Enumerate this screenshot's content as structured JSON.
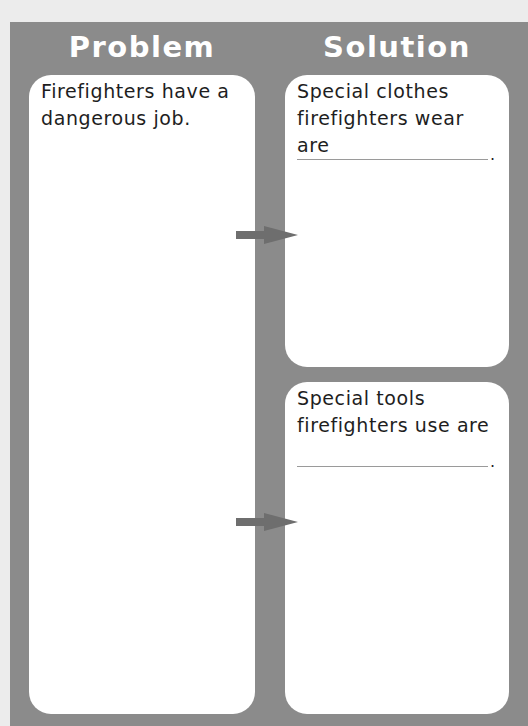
{
  "organizer": {
    "colors": {
      "background": "#ececec",
      "frame": "#8b8b8b",
      "box": "#ffffff",
      "arrow": "#6e6e6e",
      "header_text": "#ffffff",
      "body_text": "#1e1e1e"
    },
    "problem": {
      "header": "Problem",
      "text": "Firefighters have a\ndangerous job."
    },
    "solution": {
      "header": "Solution",
      "items": [
        {
          "text": "Special clothes\nfirefighters wear are",
          "blank": "",
          "period": "."
        },
        {
          "text": "Special tools\nfirefighters use are",
          "blank": "",
          "period": "."
        }
      ]
    },
    "arrows": [
      {
        "icon": "arrow-right-icon",
        "from": "problem",
        "to": "solution-1"
      },
      {
        "icon": "arrow-right-icon",
        "from": "problem",
        "to": "solution-2"
      }
    ]
  }
}
